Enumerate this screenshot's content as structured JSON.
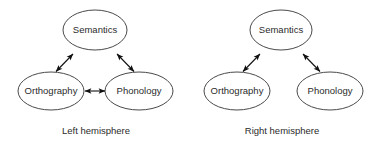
{
  "figure": {
    "background_color": "#ffffff",
    "stroke_color": "#4a4a4a",
    "arrow_color": "#111111",
    "text_color": "#2b2b2b"
  },
  "panels": [
    {
      "id": "left-hemisphere",
      "caption": "Left hemisphere",
      "nodes": [
        {
          "id": "semantics",
          "label": "Semantics",
          "cx": 95,
          "cy": 30,
          "rx": 32,
          "ry": 20
        },
        {
          "id": "orthography",
          "label": "Orthography",
          "cx": 51,
          "cy": 91,
          "rx": 33,
          "ry": 19
        },
        {
          "id": "phonology",
          "label": "Phonology",
          "cx": 139,
          "cy": 91,
          "rx": 34,
          "ry": 19
        }
      ],
      "connections": [
        {
          "id": "orthography-semantics",
          "from": "orthography",
          "to": "semantics",
          "style": "double-arrow"
        },
        {
          "id": "semantics-phonology",
          "from": "semantics",
          "to": "phonology",
          "style": "double-arrow"
        },
        {
          "id": "orthography-phonology",
          "from": "orthography",
          "to": "phonology",
          "style": "double-arrow"
        }
      ]
    },
    {
      "id": "right-hemisphere",
      "caption": "Right hemisphere",
      "nodes": [
        {
          "id": "semantics",
          "label": "Semantics",
          "cx": 281,
          "cy": 30,
          "rx": 31,
          "ry": 20
        },
        {
          "id": "orthography",
          "label": "Orthography",
          "cx": 237,
          "cy": 91,
          "rx": 33,
          "ry": 19
        },
        {
          "id": "phonology",
          "label": "Phonology",
          "cx": 330,
          "cy": 91,
          "rx": 33,
          "ry": 19
        }
      ],
      "connections": [
        {
          "id": "orthography-semantics",
          "from": "orthography",
          "to": "semantics",
          "style": "double-arrow"
        },
        {
          "id": "semantics-phonology",
          "from": "semantics",
          "to": "phonology",
          "style": "double-arrow"
        }
      ]
    }
  ],
  "captions": {
    "left": {
      "text": "Left hemisphere",
      "x": 96,
      "y": 131
    },
    "right": {
      "text": "Right hemisphere",
      "x": 282,
      "y": 131
    }
  }
}
